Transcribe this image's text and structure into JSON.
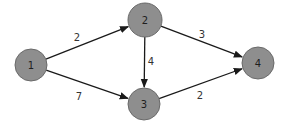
{
  "diagram": {
    "type": "directed-weighted-graph",
    "colors": {
      "node_fill": "#8e8e8e",
      "node_stroke": "#6a6a6a",
      "edge": "#1a1a1a",
      "label": "#1e1e1e",
      "background": "#ffffff"
    },
    "nodes": [
      {
        "id": "1",
        "label": "1",
        "cx": 31,
        "cy": 65,
        "r": 16
      },
      {
        "id": "2",
        "label": "2",
        "cx": 145,
        "cy": 20,
        "r": 17
      },
      {
        "id": "3",
        "label": "3",
        "cx": 144,
        "cy": 104,
        "r": 16
      },
      {
        "id": "4",
        "label": "4",
        "cx": 258,
        "cy": 63,
        "r": 16
      }
    ],
    "edges": [
      {
        "from": "1",
        "to": "2",
        "weight": "2",
        "label_x": 77,
        "label_y": 37
      },
      {
        "from": "1",
        "to": "3",
        "weight": "7",
        "label_x": 79,
        "label_y": 96
      },
      {
        "from": "2",
        "to": "3",
        "weight": "4",
        "label_x": 151,
        "label_y": 61
      },
      {
        "from": "2",
        "to": "4",
        "weight": "3",
        "label_x": 202,
        "label_y": 34
      },
      {
        "from": "3",
        "to": "4",
        "weight": "2",
        "label_x": 200,
        "label_y": 95
      }
    ]
  }
}
